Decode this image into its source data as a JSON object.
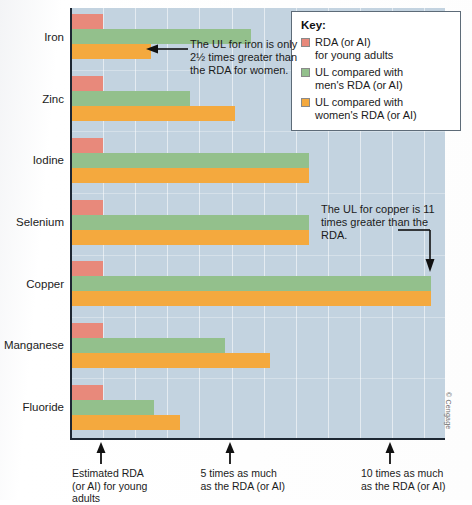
{
  "figure": {
    "credit": "© Cengage",
    "plot_background_color": "#c3d3e0"
  },
  "legend": {
    "title": "Key:",
    "items": [
      {
        "label_line1": "RDA (or AI)",
        "label_line2": "for young adults",
        "color": "#e8897b",
        "name": "rda"
      },
      {
        "label_line1": "UL compared with",
        "label_line2": "men's RDA (or AI)",
        "color": "#93c08c",
        "name": "ul-men"
      },
      {
        "label_line1": "UL compared with",
        "label_line2": "women's RDA (or AI)",
        "color": "#f4a93e",
        "name": "ul-women"
      }
    ]
  },
  "annotations": [
    {
      "id": "iron",
      "text": "The UL for iron is only 2½ times greater than the RDA for women."
    },
    {
      "id": "copper",
      "text": "The UL for copper is 11 times greater than the RDA."
    }
  ],
  "x_axis_captions": [
    {
      "line1": "Estimated RDA",
      "line2": "(or AI) for young",
      "line3": "adults",
      "value": 1
    },
    {
      "line1": "5 times as much",
      "line2": "as the RDA (or AI)",
      "line3": "",
      "value": 5
    },
    {
      "line1": "10 times as much",
      "line2": "as the RDA (or AI)",
      "line3": "",
      "value": 10
    }
  ],
  "chart_data": {
    "type": "bar",
    "orientation": "horizontal",
    "title": "",
    "subtitle": "",
    "xlabel": "Multiples of the RDA (or AI)",
    "ylabel": "",
    "xlim": [
      0,
      12
    ],
    "grid": true,
    "legend_position": "top-right",
    "categories": [
      "Iron",
      "Zinc",
      "Iodine",
      "Selenium",
      "Copper",
      "Manganese",
      "Fluoride"
    ],
    "series": [
      {
        "name": "RDA (or AI) for young adults",
        "color": "#e8897b",
        "values": [
          1,
          1,
          1,
          1,
          1,
          1,
          1
        ]
      },
      {
        "name": "UL compared with men's RDA (or AI)",
        "color": "#93c08c",
        "values": [
          5.6,
          3.7,
          7.4,
          7.4,
          11.2,
          4.8,
          2.6
        ]
      },
      {
        "name": "UL compared with women's RDA (or AI)",
        "color": "#f4a93e",
        "values": [
          2.5,
          5.1,
          7.4,
          7.4,
          11.2,
          6.2,
          3.4
        ]
      }
    ],
    "tick_values": [
      1,
      5,
      10
    ],
    "tick_labels": [
      "Estimated RDA (or AI) for young adults",
      "5 times as much as the RDA (or AI)",
      "10 times as much as the RDA (or AI)"
    ]
  }
}
